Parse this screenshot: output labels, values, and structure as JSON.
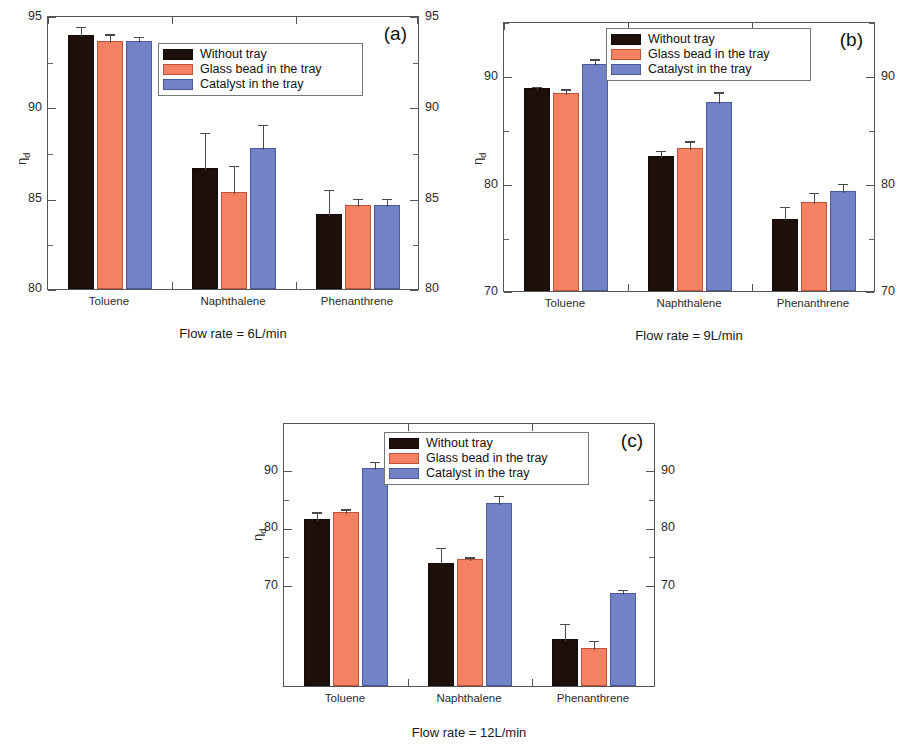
{
  "figure": {
    "series_labels": [
      "Without tray",
      "Glass bead in the tray",
      "Catalyst in the tray"
    ],
    "series_colors": [
      "#1c0f0c",
      "#f58262",
      "#7382c6"
    ],
    "ylabel_symbol": "η",
    "ylabel_subscript": "d",
    "categories": [
      "Toluene",
      "Naphthalene",
      "Phenanthrene"
    ]
  },
  "chart_data": [
    {
      "type": "bar",
      "panel": "(a)",
      "title": "Flow rate = 6L/min",
      "xlabel": "",
      "ylabel": "ηd",
      "categories": [
        "Toluene",
        "Naphthalene",
        "Phenanthrene"
      ],
      "ylim": [
        80,
        95
      ],
      "yticks": [
        80,
        85,
        90,
        95
      ],
      "ytick_labels": [
        "80",
        "85",
        "90",
        "95"
      ],
      "grid": false,
      "legend_position": "upper-center",
      "series": [
        {
          "name": "Without tray",
          "values": [
            93.9,
            86.6,
            84.1
          ],
          "errors": [
            0.55,
            2.05,
            1.45
          ]
        },
        {
          "name": "Glass bead in the tray",
          "values": [
            93.6,
            85.3,
            84.6
          ],
          "errors": [
            0.45,
            1.55,
            0.45
          ]
        },
        {
          "name": "Catalyst in the tray",
          "values": [
            93.6,
            87.7,
            84.6
          ],
          "errors": [
            0.3,
            1.4,
            0.45
          ]
        }
      ]
    },
    {
      "type": "bar",
      "panel": "(b)",
      "title": "Flow rate = 9L/min",
      "xlabel": "",
      "ylabel": "ηd",
      "categories": [
        "Toluene",
        "Naphthalene",
        "Phenanthrene"
      ],
      "ylim": [
        70,
        95
      ],
      "yticks": [
        70,
        80,
        90
      ],
      "ytick_labels": [
        "70",
        "80",
        "90"
      ],
      "grid": false,
      "legend_position": "upper-center",
      "series": [
        {
          "name": "Without tray",
          "values": [
            88.8,
            82.5,
            76.7
          ],
          "errors": [
            0.3,
            0.65,
            1.3
          ]
        },
        {
          "name": "Glass bead in the tray",
          "values": [
            88.3,
            83.2,
            78.2
          ],
          "errors": [
            0.55,
            0.85,
            1.1
          ]
        },
        {
          "name": "Catalyst in the tray",
          "values": [
            91.0,
            87.5,
            79.3
          ],
          "errors": [
            0.65,
            1.1,
            0.8
          ]
        }
      ]
    },
    {
      "type": "bar",
      "panel": "(c)",
      "title": "Flow rate = 12L/min",
      "xlabel": "",
      "ylabel": "ηd",
      "categories": [
        "Toluene",
        "Naphthalene",
        "Phenanthrene"
      ],
      "ylim": [
        65.5,
        95
      ],
      "yticks": [
        70,
        80,
        90
      ],
      "ytick_labels": [
        "70",
        "80",
        "90"
      ],
      "grid": false,
      "legend_position": "upper-center",
      "series": [
        {
          "name": "Without tray",
          "values": [
            84.2,
            79.3,
            70.8
          ],
          "errors": [
            0.95,
            1.85,
            1.9
          ]
        },
        {
          "name": "Glass bead in the tray",
          "values": [
            84.9,
            79.7,
            69.7
          ],
          "errors": [
            0.55,
            0.4,
            1.1
          ]
        },
        {
          "name": "Catalyst in the tray",
          "values": [
            89.9,
            86.0,
            75.9
          ],
          "errors": [
            0.9,
            1.0,
            0.6
          ]
        }
      ]
    }
  ]
}
